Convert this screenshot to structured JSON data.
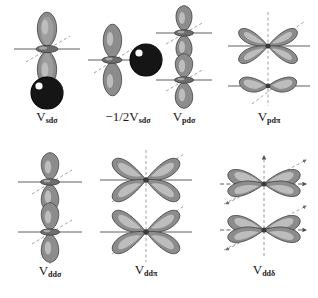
{
  "figure": {
    "kind": "orbital-overlap-diagram-set",
    "background_color": "#ffffff",
    "rows": 2,
    "columns_row1": 4,
    "columns_row2": 3
  },
  "palette": {
    "lobe_fill": "#8c8c8c",
    "lobe_fill_mid": "#9e9e9e",
    "lobe_highlight": "#bdbdbd",
    "lobe_outline": "#4a4a4a",
    "sphere_fill": "#151515",
    "sphere_edge": "#000000",
    "sphere_specular": "#ffffff",
    "axis_solid": "#4d4d4d",
    "axis_dashed": "#8a8a8a",
    "label_color": "#1a1a1a"
  },
  "panels": [
    {
      "id": "sd-sigma",
      "name": "V sd sigma",
      "label_prefix": "",
      "label_symbol": "V",
      "label_subscript": "sdσ",
      "upper_orbital": "p-orbital-vertical",
      "lower_orbital": "s-orbital-sphere",
      "axes": [
        "horizontal-solid",
        "vertical-dashed",
        "diagonal-dashed"
      ]
    },
    {
      "id": "minus-half-sd-sigma",
      "name": "minus one half V sd sigma",
      "label_prefix": "−1/2",
      "label_symbol": "V",
      "label_subscript": "sdσ",
      "upper_orbital": "p-orbital-vertical",
      "lower_orbital": "s-orbital-sphere-right",
      "axes": [
        "horizontal-solid",
        "vertical-dashed",
        "diagonal-dashed"
      ]
    },
    {
      "id": "pd-sigma",
      "name": "V pd sigma",
      "label_prefix": "",
      "label_symbol": "V",
      "label_subscript": "pdσ",
      "upper_orbital": "p-orbital-vertical",
      "lower_orbital": "d-z2-orbital-vertical",
      "axes": [
        "horizontal-solid",
        "vertical-dashed",
        "diagonal-dashed"
      ]
    },
    {
      "id": "pd-pi",
      "name": "V pd pi",
      "label_prefix": "",
      "label_symbol": "V",
      "label_subscript": "pdπ",
      "upper_orbital": "d-four-lobe-orbital",
      "lower_orbital": "p-orbital-horizontal",
      "axes": [
        "horizontal-solid",
        "vertical-dashed",
        "diagonal-dashed"
      ]
    },
    {
      "id": "dd-sigma",
      "name": "V dd sigma",
      "label_prefix": "",
      "label_symbol": "V",
      "label_subscript": "ddσ",
      "upper_orbital": "d-z2-orbital-vertical",
      "lower_orbital": "d-z2-orbital-vertical",
      "axes": [
        "horizontal-solid",
        "vertical-dashed",
        "diagonal-dashed"
      ]
    },
    {
      "id": "dd-pi",
      "name": "V dd pi",
      "label_prefix": "",
      "label_symbol": "V",
      "label_subscript": "ddπ",
      "upper_orbital": "d-four-lobe-orbital",
      "lower_orbital": "d-four-lobe-orbital",
      "axes": [
        "horizontal-solid",
        "vertical-dashed",
        "diagonal-dashed"
      ]
    },
    {
      "id": "dd-delta",
      "name": "V dd delta",
      "label_prefix": "",
      "label_symbol": "V",
      "label_subscript": "ddδ",
      "upper_orbital": "d-four-lobe-orbital-horizontal",
      "lower_orbital": "d-four-lobe-orbital-horizontal",
      "axes": [
        "horizontal-arrow",
        "vertical-dashed-arrow",
        "diagonal-dashed-arrow"
      ]
    }
  ]
}
